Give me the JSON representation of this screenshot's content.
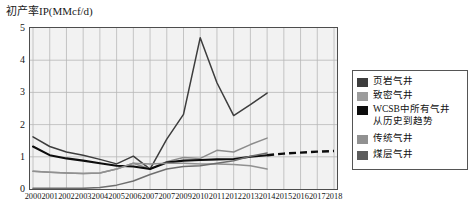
{
  "chart_data": {
    "type": "line",
    "title": "初产率IP(MMcf/d)",
    "xlabel": "",
    "ylabel": "初产率IP(MMcf/d)",
    "ylim": [
      0,
      5
    ],
    "yticks": [
      "0",
      "1",
      "2",
      "3",
      "4",
      "5"
    ],
    "grid": true,
    "legend_position": "right",
    "categories": [
      "2000",
      "2001",
      "2002",
      "2003",
      "2004",
      "2005",
      "2006",
      "2007",
      "2007",
      "2009",
      "2010",
      "2011",
      "2012",
      "2013",
      "2014",
      "2015",
      "2016",
      "2017",
      "2018"
    ],
    "series": [
      {
        "name": "页岩气井",
        "color": "#3d3d3d",
        "style": "solid",
        "values": [
          1.62,
          1.32,
          1.15,
          1.05,
          0.92,
          0.78,
          1.02,
          0.62,
          1.55,
          2.32,
          4.7,
          3.3,
          2.28,
          2.62,
          2.98,
          null,
          null,
          null,
          null
        ]
      },
      {
        "name": "致密气井",
        "color": "#8c8c8c",
        "style": "solid",
        "values": [
          0.55,
          0.52,
          0.5,
          0.48,
          0.5,
          0.62,
          0.8,
          0.62,
          0.85,
          0.98,
          0.95,
          1.2,
          1.15,
          1.38,
          1.58,
          null,
          null,
          null,
          null
        ]
      },
      {
        "name": "WCSB中所有气井\n从历史到趋势",
        "color": "#0d0d0d",
        "style": "solid-then-dashed",
        "dash_from_index": 14,
        "values": [
          1.32,
          1.05,
          0.95,
          0.88,
          0.8,
          0.72,
          0.7,
          0.62,
          0.82,
          0.88,
          0.9,
          0.92,
          0.93,
          1.0,
          1.05,
          1.1,
          1.13,
          1.16,
          1.18
        ]
      },
      {
        "name": "传统气井",
        "color": "#919191",
        "style": "solid",
        "values": [
          0.55,
          0.52,
          0.5,
          0.48,
          0.5,
          0.62,
          0.8,
          0.78,
          0.8,
          0.8,
          0.78,
          0.78,
          0.76,
          0.72,
          0.62,
          null,
          null,
          null,
          null
        ]
      },
      {
        "name": "煤层气井",
        "color": "#6e6e6e",
        "style": "solid",
        "values": [
          0.02,
          0.02,
          0.02,
          0.02,
          0.05,
          0.12,
          0.25,
          0.45,
          0.62,
          0.7,
          0.72,
          0.8,
          0.88,
          1.02,
          1.12,
          null,
          null,
          null,
          null
        ]
      }
    ]
  },
  "legend": {
    "items": [
      {
        "label": "页岩气井",
        "color": "#3d3d3d"
      },
      {
        "label": "致密气井",
        "color": "#9c9c9c"
      },
      {
        "label": "WCSB中所有气井\n从历史到趋势",
        "color": "#0d0d0d"
      },
      {
        "label": "传统气井",
        "color": "#919191"
      },
      {
        "label": "煤层气井",
        "color": "#5c5c5c"
      }
    ]
  }
}
